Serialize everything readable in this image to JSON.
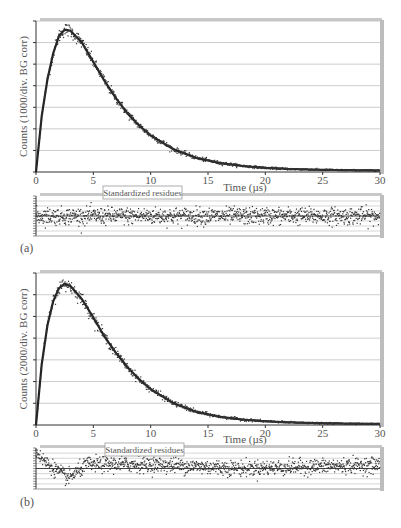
{
  "figure": {
    "panels": [
      {
        "label": "(a)"
      },
      {
        "label": "(b)"
      }
    ]
  },
  "chart_data": [
    {
      "type": "scatter",
      "panel": "(a)",
      "title": "",
      "xlabel": "Time (µs)",
      "ylabel": "Counts (1000/div. BG corr)",
      "xlim": [
        0,
        30
      ],
      "ylim": [
        0,
        7
      ],
      "x_ticks": [
        0,
        5,
        10,
        15,
        20,
        25,
        30
      ],
      "y_gridlines": 7,
      "y_tick_labels_shown": false,
      "grid": true,
      "description": "Luminescence decay: rise from 0 to peak near t=2.5 µs (~6.6 divisions), then decay to near zero by ~25 µs",
      "series": [
        {
          "name": "data",
          "x": [
            0,
            0.5,
            1,
            1.5,
            2,
            2.5,
            3,
            4,
            5,
            6,
            7,
            8,
            9,
            10,
            12,
            14,
            16,
            18,
            20,
            22,
            25,
            28,
            30
          ],
          "values": [
            0,
            2.6,
            4.3,
            5.5,
            6.3,
            6.6,
            6.55,
            6.0,
            5.1,
            4.2,
            3.4,
            2.7,
            2.15,
            1.7,
            1.05,
            0.65,
            0.42,
            0.28,
            0.19,
            0.14,
            0.1,
            0.08,
            0.07
          ]
        }
      ],
      "residuals": {
        "label": "Standardized residues",
        "ylim": [
          -4,
          4
        ],
        "pattern": "random scatter about zero across full range"
      }
    },
    {
      "type": "scatter",
      "panel": "(b)",
      "title": "",
      "xlabel": "Time (µs)",
      "ylabel": "Counts (2000/div. BG corr)",
      "xlim": [
        0,
        30
      ],
      "ylim": [
        0,
        7
      ],
      "x_ticks": [
        0,
        5,
        10,
        15,
        20,
        25,
        30
      ],
      "y_gridlines": 7,
      "y_tick_labels_shown": false,
      "grid": true,
      "description": "Luminescence decay: rise from 0 to peak near t=2.5 µs (~6.5 divisions), then decay to near zero by ~25 µs",
      "series": [
        {
          "name": "data",
          "x": [
            0,
            0.5,
            1,
            1.5,
            2,
            2.5,
            3,
            4,
            5,
            6,
            7,
            8,
            9,
            10,
            12,
            14,
            16,
            18,
            20,
            22,
            25,
            28,
            30
          ],
          "values": [
            0,
            2.8,
            4.6,
            5.7,
            6.3,
            6.5,
            6.4,
            5.8,
            4.95,
            4.05,
            3.3,
            2.65,
            2.1,
            1.65,
            1.0,
            0.6,
            0.38,
            0.25,
            0.17,
            0.12,
            0.08,
            0.06,
            0.05
          ]
        }
      ],
      "residuals": {
        "label": "Standardized residues",
        "ylim": [
          -4,
          4
        ],
        "pattern": "systematic: starts high (~+3.5) at t<1, drops to ~-2 around t=2-3, rises to ~+1 at t=5-10, then scatter about ~0 with slight positive drift at late times"
      }
    }
  ]
}
